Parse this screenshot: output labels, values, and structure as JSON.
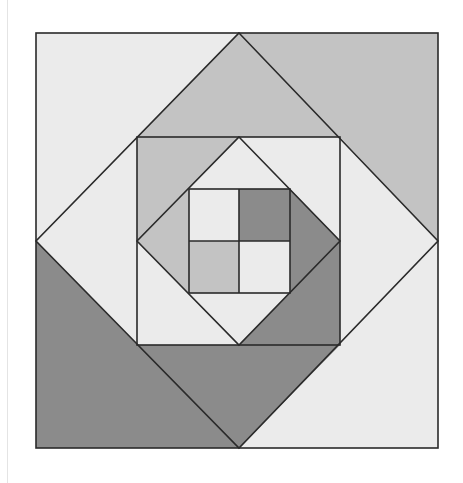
{
  "figure": {
    "colors": {
      "light": "#ebebeb",
      "medium": "#c3c3c3",
      "dark": "#8b8b8b",
      "outline": "#2a2a2a",
      "background": "#ffffff"
    },
    "layers": [
      {
        "name": "outer-square",
        "corners": {
          "top_left": "light",
          "top_right": "medium",
          "bottom_left": "dark",
          "bottom_right": "light"
        }
      },
      {
        "name": "outer-diamond-gaps",
        "triangles": {
          "top": "medium",
          "left": "light",
          "right": "light",
          "bottom": "dark"
        }
      },
      {
        "name": "middle-square-corners",
        "corners": {
          "top_left": "medium",
          "top_right": "light",
          "bottom_left": "light",
          "bottom_right": "dark"
        }
      },
      {
        "name": "inner-diamond-gaps",
        "triangles": {
          "top": "light",
          "left": "medium",
          "right": "dark",
          "bottom": "light"
        }
      },
      {
        "name": "center-four-patch",
        "cells": {
          "top_left": "light",
          "top_right": "dark",
          "bottom_left": "medium",
          "bottom_right": "light"
        }
      }
    ]
  }
}
